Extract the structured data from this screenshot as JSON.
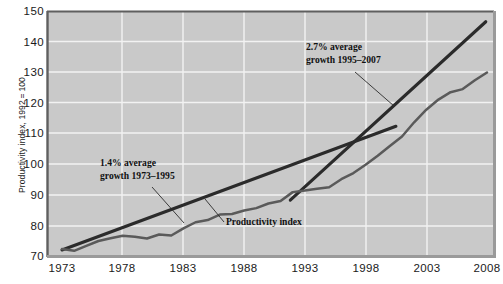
{
  "chart_data": {
    "type": "line",
    "title": "",
    "xlabel": "",
    "ylabel": "Productivity index, 1992 = 100",
    "xlim": [
      1973,
      2008
    ],
    "ylim": [
      70,
      150
    ],
    "grid": true,
    "legend_position": "none",
    "xticks": [
      "1973",
      "1978",
      "1983",
      "1988",
      "1993",
      "1998",
      "2003",
      "2008"
    ],
    "yticks": [
      "70",
      "80",
      "90",
      "100",
      "110",
      "120",
      "130",
      "140",
      "150"
    ],
    "x": [
      1973,
      1974,
      1975,
      1976,
      1977,
      1978,
      1979,
      1980,
      1981,
      1982,
      1983,
      1984,
      1985,
      1986,
      1987,
      1988,
      1989,
      1990,
      1991,
      1992,
      1993,
      1994,
      1995,
      1996,
      1997,
      1998,
      1999,
      2000,
      2001,
      2002,
      2003,
      2004,
      2005,
      2006,
      2007,
      2008
    ],
    "series": [
      {
        "name": "Productivity index",
        "color": "#5a5a5a",
        "values": [
          72.6,
          72.0,
          73.6,
          75.2,
          76.1,
          76.9,
          76.6,
          76.0,
          77.3,
          77.0,
          79.3,
          81.3,
          82.0,
          83.8,
          84.0,
          85.1,
          85.9,
          87.4,
          88.2,
          91.1,
          91.6,
          92.2,
          92.7,
          95.3,
          97.3,
          100.0,
          102.9,
          106.1,
          109.2,
          113.8,
          117.9,
          121.2,
          123.6,
          124.6,
          127.5,
          130.0
        ]
      }
    ],
    "trend_lines": [
      {
        "name": "trend-1973-1995",
        "label_line1": "1.4% average",
        "label_line2": "growth 1973–1995",
        "growth_rate": "1.4%",
        "period": "1973–1995",
        "x_start": 1973,
        "y_start": 72.3,
        "x_end": 2000.5,
        "y_end": 112.5,
        "color": "#2b2b2b"
      },
      {
        "name": "trend-1995-2007",
        "label_line1": "2.7% average",
        "label_line2": "growth 1995–2007",
        "growth_rate": "2.7%",
        "period": "1995–2007",
        "x_start": 1991.8,
        "y_start": 88.5,
        "x_end": 2007.9,
        "y_end": 146.5,
        "color": "#2b2b2b"
      }
    ],
    "annotations": [
      {
        "name": "series-callout",
        "text": "Productivity index"
      }
    ],
    "plot_background": "#c9c9c9",
    "gridline_color": "#f2f2f2"
  }
}
